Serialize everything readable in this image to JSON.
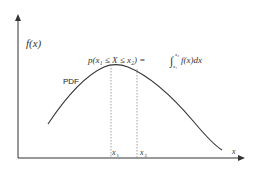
{
  "diagram": {
    "y_axis_label": "f(x)",
    "x_axis_label": "x",
    "curve_label": "PDF",
    "formula": {
      "lhs": "p(x₁ ≤ X ≤ x₂) = ",
      "integral": "∫",
      "upper": "x₂",
      "lower": "x₁",
      "rhs": "f(x)dx"
    },
    "markers": [
      {
        "label": "x",
        "sub": "1"
      },
      {
        "label": "x",
        "sub": "2"
      }
    ],
    "colors": {
      "axis": "#333333",
      "curve": "#333333",
      "dotted": "#888888",
      "background": "#ffffff"
    }
  }
}
